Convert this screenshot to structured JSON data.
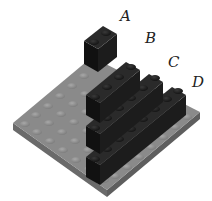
{
  "figure": {
    "colors": {
      "baseplate_top": "#8a8a8a",
      "baseplate_side": "#6e6e6e",
      "stud": "#9a9a9a",
      "brick_top": "#2a2a2a",
      "brick_side_left": "#141414",
      "brick_side_right": "#1e1e1e",
      "label": "#222222"
    },
    "labels": [
      {
        "id": "A",
        "text": "A",
        "x": 120,
        "y": 9
      },
      {
        "id": "B",
        "text": "B",
        "x": 145,
        "y": 31
      },
      {
        "id": "C",
        "text": "C",
        "x": 168,
        "y": 55
      },
      {
        "id": "D",
        "text": "D",
        "x": 192,
        "y": 75
      }
    ]
  }
}
